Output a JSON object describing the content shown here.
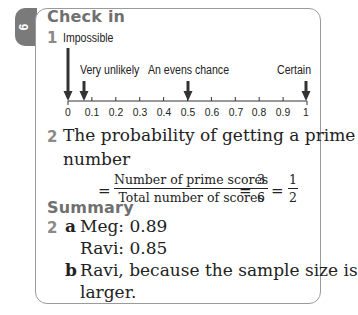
{
  "tab": {
    "label": "9"
  },
  "check_in": {
    "heading": "Check in",
    "q1": {
      "number": "1",
      "labels": {
        "impossible": "Impossible",
        "very_unlikely": "Very unlikely",
        "evens": "An evens chance",
        "certain": "Certain"
      },
      "ticks": [
        "0",
        "0.1",
        "0.2",
        "0.3",
        "0.4",
        "0.5",
        "0.6",
        "0.7",
        "0.8",
        "0.9",
        "1"
      ],
      "arrow_positions": {
        "impossible": 0,
        "very_unlikely": 0.07,
        "evens": 0.5,
        "certain": 1
      }
    },
    "q2": {
      "number": "2",
      "line1": "The probability of getting a prime",
      "line2": "number",
      "equals": "=",
      "fraction_numerator": "Number of prime scores",
      "fraction_denominator": "Total number of scores",
      "frac2_num": "3",
      "frac2_den": "6",
      "frac3_num": "1",
      "frac3_den": "2"
    }
  },
  "summary": {
    "heading": "Summary",
    "q2": {
      "number": "2",
      "a_label": "a",
      "a_line1": "Meg: 0.89",
      "a_line2": "Ravi: 0.85",
      "b_label": "b",
      "b_line1": "Ravi, because the sample size is",
      "b_line2": "larger."
    }
  }
}
